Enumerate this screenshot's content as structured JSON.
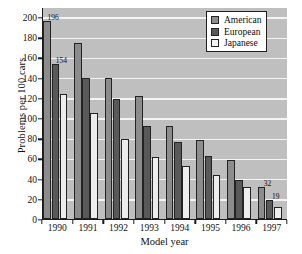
{
  "chart_data": {
    "type": "bar",
    "title": "",
    "xlabel": "Model year",
    "ylabel": "Problems per 100 cars",
    "categories": [
      "1990",
      "1991",
      "1992",
      "1993",
      "1994",
      "1995",
      "1996",
      "1997"
    ],
    "series": [
      {
        "name": "American",
        "color": "#8c8c8c",
        "values": [
          196,
          174,
          140,
          122,
          92,
          78,
          58,
          32
        ]
      },
      {
        "name": "European",
        "color": "#595959",
        "values": [
          154,
          140,
          119,
          92,
          76,
          62,
          39,
          19
        ]
      },
      {
        "name": "Japanese",
        "color": "#ededed",
        "values": [
          124,
          105,
          79,
          61,
          53,
          44,
          32,
          12
        ]
      }
    ],
    "ylim": [
      0,
      210
    ],
    "yticks": [
      0,
      20,
      40,
      60,
      80,
      100,
      120,
      140,
      160,
      180,
      200
    ],
    "grid": true,
    "legend_position": "top-right",
    "plot_background": "#bfbfbf",
    "gridline_color": "#f4f4f4",
    "annotations": [
      {
        "category": "1990",
        "series": "American",
        "value": 196,
        "text": "196"
      },
      {
        "category": "1990",
        "series": "European",
        "value": 154,
        "text": "154"
      },
      {
        "category": "1997",
        "series": "American",
        "value": 32,
        "text": "32"
      },
      {
        "category": "1997",
        "series": "European",
        "value": 19,
        "text": "19"
      }
    ]
  }
}
